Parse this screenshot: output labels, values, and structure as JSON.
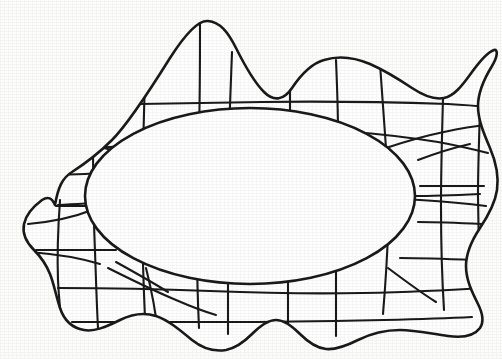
{
  "figure": {
    "title": "Irregular closed region with inscribed ellipse and curvilinear grid",
    "canvas": {
      "width": 502,
      "height": 359
    },
    "colors": {
      "background": "#fdfdfc",
      "stroke": "#1a1a1a",
      "fill": "#ffffff"
    },
    "stroke_widths": {
      "outer_boundary": 2.6,
      "inner_ellipse": 2.6,
      "grid_line": 2.1
    },
    "outer_boundary": {
      "name": "wavy-blob-outline",
      "closed": true,
      "path": "M 55 205 C 58 188 62 178 72 172 C 86 163 100 152 112 140 C 128 124 150 90 170 58 C 184 36 198 20 208 21 C 220 22 228 32 236 48 C 245 66 254 82 264 92 C 274 102 284 100 292 88 C 300 76 310 64 324 60 C 340 55 356 58 370 64 C 386 71 400 80 412 88 C 424 96 434 100 444 98 C 454 96 462 86 472 72 C 480 61 488 52 494 50 C 498 49 498 56 492 66 C 484 79 478 92 478 106 C 478 120 484 134 490 148 C 496 162 499 176 497 190 C 495 204 488 216 480 228 C 472 240 466 252 466 266 C 466 280 472 292 478 304 C 483 314 484 322 480 328 C 474 336 462 338 448 336 C 432 334 416 330 400 330 C 384 330 370 334 358 340 C 346 346 336 350 326 349 C 316 348 308 342 300 334 C 292 326 284 320 276 320 C 268 320 260 326 252 334 C 244 342 236 348 226 350 C 214 352 202 348 192 340 C 180 330 168 320 156 316 C 144 312 132 314 120 320 C 106 327 94 332 84 330 C 72 328 64 320 60 308 C 56 296 54 284 50 274 C 46 264 40 256 34 250 C 26 242 22 234 24 224 C 26 214 34 206 42 200 C 48 196 52 198 55 205 Z"
    },
    "inner_ellipse": {
      "name": "inner-ellipse",
      "cx": 250,
      "cy": 196,
      "rx": 165,
      "ry": 88,
      "rotation_deg": 0
    },
    "grid_lines": [
      {
        "id": "h1",
        "orientation": "horizontal",
        "path": "M 56 206 C 96 206 140 206 180 206"
      },
      {
        "id": "h-top-1",
        "orientation": "horizontal",
        "path": "M 58 205 C 120 202 180 198 240 196 C 300 194 360 196 420 200 C 450 202 470 204 486 206"
      },
      {
        "id": "h-top-2",
        "orientation": "horizontal",
        "path": "M 78 105 C 140 104 200 103 262 102 C 324 101 386 102 448 104 C 466 105 478 106 488 107"
      },
      {
        "id": "h-top-3",
        "orientation": "horizontal",
        "path": "M 88 148 C 140 146 186 143 224 140 C 262 137 292 134 318 132"
      },
      {
        "id": "h-top-3b",
        "orientation": "horizontal",
        "path": "M 352 132 C 382 134 412 138 438 142 C 460 146 476 150 488 153"
      },
      {
        "id": "h-right-1",
        "orientation": "horizontal",
        "path": "M 420 186 C 440 186 462 186 484 186"
      },
      {
        "id": "h-right-2",
        "orientation": "horizontal",
        "path": "M 418 222 C 440 222 462 223 482 224"
      },
      {
        "id": "h-right-3",
        "orientation": "horizontal",
        "path": "M 400 258 C 424 258 450 259 474 260"
      },
      {
        "id": "h-left-1",
        "orientation": "horizontal",
        "path": "M 44 175 C 64 175 84 174 102 173"
      },
      {
        "id": "h-left-2",
        "orientation": "horizontal",
        "path": "M 36 250 C 62 250 90 250 116 250"
      },
      {
        "id": "h-bottom-1",
        "orientation": "horizontal",
        "path": "M 58 288 C 110 288 160 289 210 291 C 262 293 312 294 362 293 C 412 292 452 290 480 288"
      },
      {
        "id": "h-bottom-2",
        "orientation": "horizontal",
        "path": "M 72 322 C 124 322 176 322 228 322 C 280 322 332 321 384 320 C 424 319 452 318 472 317"
      },
      {
        "id": "h-left-diag",
        "orientation": "horizontal",
        "path": "M 30 252 C 56 254 80 258 100 264"
      },
      {
        "id": "v-1",
        "orientation": "vertical",
        "path": "M 96 28 C 94 70 93 112 93 154 C 93 196 94 238 96 280 C 97 310 98 330 99 344"
      },
      {
        "id": "v-2",
        "orientation": "vertical",
        "path": "M 146 40 C 145 78 144 114 143 150 C 142 188 142 226 143 264 C 144 296 145 320 146 338"
      },
      {
        "id": "v-3",
        "orientation": "vertical",
        "path": "M 200 22 C 200 60 200 96 199 132 C 198 170 197 208 197 246 C 197 280 198 306 199 328"
      },
      {
        "id": "v-4",
        "orientation": "vertical",
        "path": "M 232 52 C 231 80 230 106 229 132"
      },
      {
        "id": "v-4b",
        "orientation": "vertical",
        "path": "M 228 262 C 228 286 228 310 228 334"
      },
      {
        "id": "v-5",
        "orientation": "vertical",
        "path": "M 290 62 C 290 86 290 108 290 130"
      },
      {
        "id": "v-5b",
        "orientation": "vertical",
        "path": "M 288 268 C 288 292 288 316 288 340"
      },
      {
        "id": "v-6",
        "orientation": "vertical",
        "path": "M 336 60 C 337 84 338 108 338 132"
      },
      {
        "id": "v-6b",
        "orientation": "vertical",
        "path": "M 336 272 C 336 296 336 316 336 336"
      },
      {
        "id": "v-7",
        "orientation": "vertical",
        "path": "M 380 64 C 382 92 384 120 386 148 C 388 176 389 204 388 232 C 387 264 385 290 383 314"
      },
      {
        "id": "v-8",
        "orientation": "vertical",
        "path": "M 443 98 C 442 134 441 170 441 206 C 441 242 442 278 444 310"
      },
      {
        "id": "v-9",
        "orientation": "vertical",
        "path": "M 480 110 C 479 140 478 168 478 196 C 478 226 479 256 481 286"
      },
      {
        "id": "v-10",
        "orientation": "vertical",
        "path": "M 60 200 C 58 228 57 254 58 280 C 59 302 61 318 63 330"
      },
      {
        "id": "d-tl-1",
        "orientation": "diagonal",
        "path": "M 28 224 C 50 222 72 218 92 210"
      },
      {
        "id": "d-tl-2",
        "orientation": "diagonal",
        "path": "M 104 148 C 122 152 142 160 160 170 C 176 179 190 188 200 196"
      },
      {
        "id": "d-bl-1",
        "orientation": "diagonal",
        "path": "M 108 268 C 128 278 152 290 176 300 C 192 307 206 312 216 315"
      },
      {
        "id": "d-bl-2",
        "orientation": "diagonal",
        "path": "M 146 268 C 152 292 156 314 158 334"
      },
      {
        "id": "d-br-1",
        "orientation": "diagonal",
        "path": "M 388 268 C 404 280 420 292 436 302"
      },
      {
        "id": "d-tr-1",
        "orientation": "diagonal",
        "path": "M 386 148 C 404 142 424 136 444 132 C 462 128 476 126 488 125"
      },
      {
        "id": "d-tr-2",
        "orientation": "diagonal",
        "path": "M 418 160 C 434 154 452 148 470 144"
      },
      {
        "id": "d-r-1",
        "orientation": "diagonal",
        "path": "M 414 196 C 436 196 458 195 480 194"
      },
      {
        "id": "ell-tl-spoke",
        "orientation": "radial",
        "path": "M 134 142 C 150 152 166 162 180 172"
      },
      {
        "id": "ell-bl-spoke",
        "orientation": "radial",
        "path": "M 116 262 C 134 272 152 282 168 292"
      }
    ],
    "region_counts": {
      "grid_lines_total": 38,
      "closed_shapes": 2
    }
  }
}
